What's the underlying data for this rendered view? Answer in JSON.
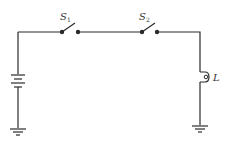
{
  "diagram": {
    "type": "circuit-schematic",
    "switches": [
      {
        "id": "S1",
        "label": "S",
        "subscript": "1",
        "state": "open"
      },
      {
        "id": "S2",
        "label": "S",
        "subscript": "2",
        "state": "open"
      }
    ],
    "lamp": {
      "label": "L"
    },
    "battery": {
      "label": ""
    },
    "grounds": 2,
    "colors": {
      "line": "#2a2a2a",
      "background": "#ffffff"
    }
  }
}
